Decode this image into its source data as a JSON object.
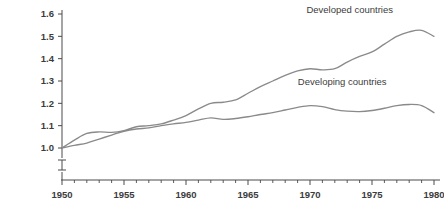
{
  "chart_data": {
    "type": "line",
    "title": "",
    "subtitle": "",
    "xlabel": "",
    "ylabel": "",
    "xlim": [
      1950,
      1980
    ],
    "ylim": [
      1.0,
      1.6
    ],
    "grid": false,
    "legend_position": "inline-labels",
    "y_ticks": [
      "1.0",
      "1.1",
      "1.2",
      "1.3",
      "1.4",
      "1.5",
      "1.6"
    ],
    "y_tick_values": [
      1.0,
      1.1,
      1.2,
      1.3,
      1.4,
      1.5,
      1.6
    ],
    "x_ticks": [
      "1950",
      "1955",
      "1960",
      "1965",
      "1970",
      "1975",
      "1980"
    ],
    "x_tick_values": [
      1950,
      1955,
      1960,
      1965,
      1970,
      1975,
      1980
    ],
    "x_minor_tick_interval": 1,
    "axis_break": true,
    "axis_break_note": "y-axis broken below 1.0",
    "line_color": "#8a8a8a",
    "axis_color": "#4a4a4a",
    "text_color": "#3c3c3c",
    "x": [
      1950,
      1951,
      1952,
      1953,
      1954,
      1955,
      1956,
      1957,
      1958,
      1959,
      1960,
      1961,
      1962,
      1963,
      1964,
      1965,
      1966,
      1967,
      1968,
      1969,
      1970,
      1971,
      1972,
      1973,
      1974,
      1975,
      1976,
      1977,
      1978,
      1979,
      1980
    ],
    "series": [
      {
        "name": "Developed countries",
        "label": "Developed countries",
        "color": "#8a8a8a",
        "label_x": 1973.2,
        "label_y": 1.605,
        "values": [
          1.0,
          1.035,
          1.065,
          1.072,
          1.07,
          1.078,
          1.095,
          1.1,
          1.108,
          1.125,
          1.145,
          1.175,
          1.2,
          1.205,
          1.215,
          1.245,
          1.275,
          1.3,
          1.325,
          1.345,
          1.355,
          1.35,
          1.355,
          1.385,
          1.41,
          1.43,
          1.465,
          1.5,
          1.52,
          1.527,
          1.5
        ]
      },
      {
        "name": "Developing countries",
        "label": "Developing countries",
        "color": "#8a8a8a",
        "label_x": 1972.6,
        "label_y": 1.283,
        "values": [
          1.0,
          1.012,
          1.022,
          1.04,
          1.058,
          1.075,
          1.085,
          1.09,
          1.1,
          1.108,
          1.115,
          1.125,
          1.135,
          1.128,
          1.132,
          1.14,
          1.15,
          1.158,
          1.17,
          1.182,
          1.19,
          1.185,
          1.172,
          1.165,
          1.163,
          1.168,
          1.178,
          1.19,
          1.195,
          1.19,
          1.158
        ]
      }
    ]
  }
}
